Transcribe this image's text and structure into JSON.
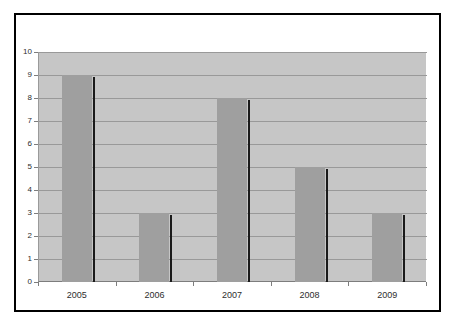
{
  "chart_data": {
    "type": "bar",
    "title": "",
    "categories": [
      "2005",
      "2006",
      "2007",
      "2008",
      "2009"
    ],
    "values": [
      9,
      3,
      8,
      5,
      3
    ],
    "xlabel": "",
    "ylabel": "",
    "ylim": [
      0,
      10
    ],
    "ytick_step": 1,
    "ytick_labels": [
      "0",
      "1",
      "2",
      "3",
      "4",
      "5",
      "6",
      "7",
      "8",
      "9",
      "10"
    ],
    "grid": "horizontal",
    "legend": "none",
    "bar_shadow": true
  },
  "colors": {
    "page_background": "#ffffff",
    "frame_border": "#000000",
    "plot_background": "#c6c6c6",
    "gridline": "#999999",
    "axis_line": "#7d7d7d",
    "bar_fill": "#9f9f9f",
    "bar_shadow": "#1a1a1a",
    "tick_label": "#2e2e2e"
  }
}
